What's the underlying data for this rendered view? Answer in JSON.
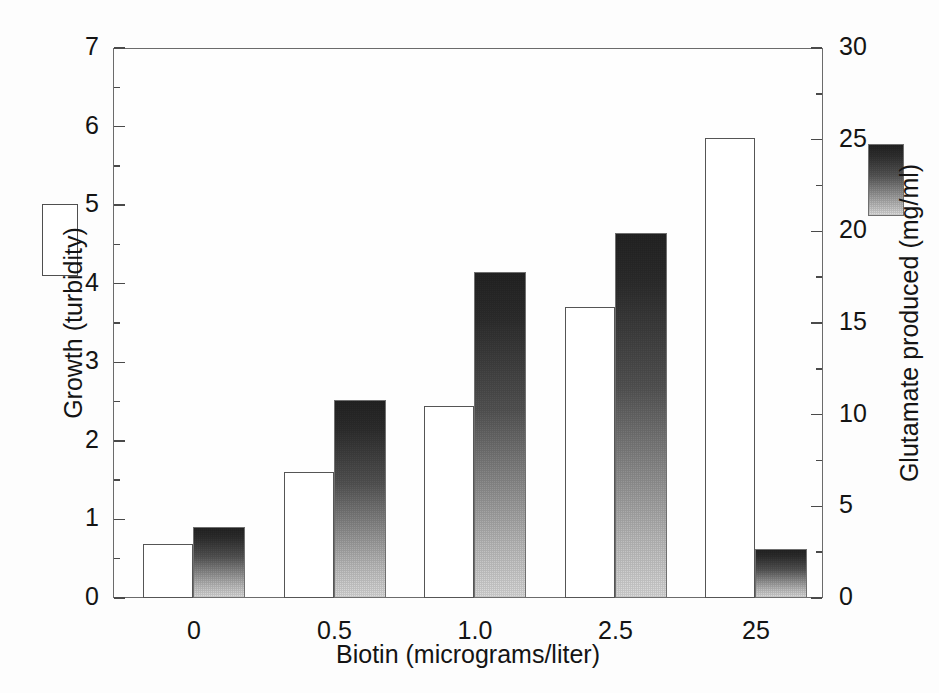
{
  "chart_data": {
    "type": "bar",
    "title": "",
    "subtitle": "",
    "xlabel": "Biotin (micrograms/liter)",
    "categories": [
      "0",
      "0.5",
      "1.0",
      "2.5",
      "25"
    ],
    "grid": false,
    "legend_position": "outside-left-and-right",
    "axes": {
      "left": {
        "label": "Growth (turbidity)",
        "ticklabels": [
          "0",
          "1",
          "2",
          "3",
          "4",
          "5",
          "6",
          "7"
        ],
        "tickvalues": [
          0,
          1,
          2,
          3,
          4,
          5,
          6,
          7
        ],
        "minor_tickvalues": [
          0.5,
          1.5,
          2.5,
          3.5,
          4.5,
          5.5,
          6.5
        ],
        "ylim": [
          0,
          7
        ]
      },
      "right": {
        "label": "Glutamate produced (mg/ml)",
        "ticklabels": [
          "0",
          "5",
          "10",
          "15",
          "20",
          "25",
          "30"
        ],
        "tickvalues": [
          0,
          5,
          10,
          15,
          20,
          25,
          30
        ],
        "minor_tickvalues": [
          2.5,
          7.5,
          12.5,
          17.5,
          22.5,
          27.5
        ],
        "ylim": [
          0,
          30
        ]
      }
    },
    "series": [
      {
        "name": "Growth (turbidity)",
        "axis": "left",
        "style": "open-white-bar",
        "color": "#ffffff",
        "edge_color": "#555555",
        "values": [
          0.69,
          1.6,
          2.45,
          3.7,
          5.85
        ]
      },
      {
        "name": "Glutamate produced (mg/ml)",
        "axis": "right",
        "style": "gradient-bar",
        "color_top": "#242424",
        "color_bottom": "#dcdcdc",
        "values": [
          3.9,
          10.8,
          17.8,
          19.9,
          2.7
        ]
      }
    ]
  },
  "legend": {
    "growth": {
      "name": "growth-swatch",
      "description": "open white rectangle"
    },
    "glutamate": {
      "name": "glutamate-swatch",
      "description": "dark-to-light gradient rectangle"
    }
  }
}
